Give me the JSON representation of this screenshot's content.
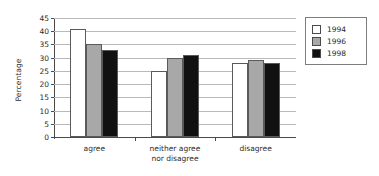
{
  "chart_data": {
    "type": "bar",
    "title": "",
    "xlabel": "",
    "ylabel": "Percentage",
    "categories": [
      "agree",
      "neither agree\nnor disagree",
      "disagree"
    ],
    "series": [
      {
        "name": "1994",
        "values": [
          41,
          25,
          28
        ],
        "color": "#ffffff"
      },
      {
        "name": "1996",
        "values": [
          35,
          30,
          29
        ],
        "color": "#a8a8a8"
      },
      {
        "name": "1998",
        "values": [
          33,
          31,
          28
        ],
        "color": "#111111"
      }
    ],
    "ylim": [
      0,
      45
    ],
    "ytick_step": 5,
    "yticks": [
      "0",
      "5",
      "10",
      "15",
      "20",
      "25",
      "30",
      "35",
      "40",
      "45"
    ],
    "grid": "horizontal",
    "legend_position": "right-outside"
  },
  "legend": {
    "entries": [
      {
        "label": "1994"
      },
      {
        "label": "1996"
      },
      {
        "label": "1998"
      }
    ]
  },
  "axes": {
    "y_title": "Percentage"
  }
}
